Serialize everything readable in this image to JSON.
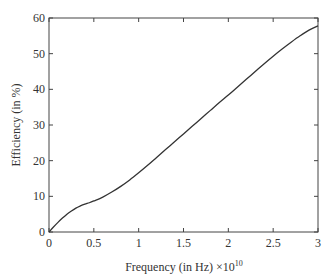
{
  "chart_data": {
    "type": "line",
    "title": "",
    "xlabel": "Frequency (in Hz) ×10",
    "xlabel_exponent": "10",
    "ylabel": "Efficiency (in %)",
    "xlim": [
      0,
      3
    ],
    "ylim": [
      0,
      60
    ],
    "x_ticks": [
      0,
      0.5,
      1,
      1.5,
      2,
      2.5,
      3
    ],
    "x_tick_labels": [
      "0",
      "0.5",
      "1",
      "1.5",
      "2",
      "2.5",
      "3"
    ],
    "y_ticks": [
      0,
      10,
      20,
      30,
      40,
      50,
      60
    ],
    "y_tick_labels": [
      "0",
      "10",
      "20",
      "30",
      "40",
      "50",
      "60"
    ],
    "grid": false,
    "legend": null,
    "series": [
      {
        "name": "Efficiency",
        "color": "#333333",
        "x": [
          0,
          0.05,
          0.1,
          0.15,
          0.2,
          0.25,
          0.3,
          0.35,
          0.4,
          0.45,
          0.5,
          0.6,
          0.7,
          0.8,
          0.9,
          1.0,
          1.1,
          1.2,
          1.3,
          1.4,
          1.5,
          1.6,
          1.7,
          1.8,
          1.9,
          2.0,
          2.1,
          2.2,
          2.3,
          2.4,
          2.5,
          2.6,
          2.7,
          2.8,
          2.9,
          3.0
        ],
        "y": [
          0,
          1.4,
          2.7,
          3.9,
          5.0,
          5.9,
          6.7,
          7.3,
          7.8,
          8.2,
          8.7,
          9.8,
          11.2,
          12.8,
          14.6,
          16.6,
          18.7,
          20.9,
          23.1,
          25.3,
          27.5,
          29.7,
          31.9,
          34.1,
          36.3,
          38.4,
          40.6,
          42.8,
          45.0,
          47.2,
          49.3,
          51.3,
          53.2,
          55.0,
          56.6,
          57.8
        ]
      }
    ]
  }
}
